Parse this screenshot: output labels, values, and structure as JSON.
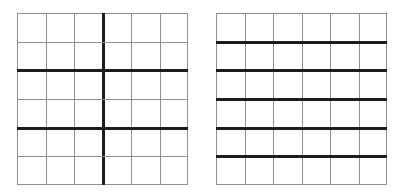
{
  "figure": {
    "background_color": "#ffffff",
    "width": 404,
    "height": 196,
    "thin_line_color": "#8f8f8f",
    "thick_line_color": "#1c1c1c",
    "thin_line_width": 1,
    "thick_line_width": 3,
    "panel_count": 2
  },
  "panels": [
    {
      "id": "left-grid",
      "name": "left-grid",
      "description": "6 by 6 grid with one thick vertical divider at the center and thick horizontal dividers after rows 2 and 4",
      "x": 17,
      "y": 13,
      "width": 171,
      "height": 172,
      "columns": 6,
      "rows": 6,
      "thick_vertical_dividers": [
        3
      ],
      "thick_horizontal_dividers": [
        2,
        4
      ],
      "thin_vertical_dividers": [
        1,
        2,
        4,
        5
      ],
      "thin_horizontal_dividers": [
        1,
        3,
        5
      ]
    },
    {
      "id": "right-grid",
      "name": "right-grid",
      "description": "6 by 6 grid with thick horizontal dividers at every interior row boundary and thin vertical dividers",
      "x": 216,
      "y": 13,
      "width": 171,
      "height": 172,
      "columns": 6,
      "rows": 6,
      "thick_vertical_dividers": [],
      "thick_horizontal_dividers": [
        1,
        2,
        3,
        4,
        5
      ],
      "thin_vertical_dividers": [
        1,
        2,
        3,
        4,
        5
      ],
      "thin_horizontal_dividers": []
    }
  ],
  "chart_data": {
    "type": "table",
    "title": "",
    "subtitle": "",
    "xlabel": "",
    "ylabel": "",
    "grid": true,
    "legend_position": "none",
    "annotations": [],
    "panels": [
      {
        "name": "left-grid",
        "rows": 6,
        "columns": 6,
        "cells_total": 36,
        "emphasized_column_boundaries": [
          3
        ],
        "emphasized_row_boundaries": [
          2,
          4
        ],
        "partition_blocks_horizontal": [
          3,
          3
        ],
        "partition_blocks_vertical": [
          2,
          2,
          2
        ]
      },
      {
        "name": "right-grid",
        "rows": 6,
        "columns": 6,
        "cells_total": 36,
        "emphasized_column_boundaries": [],
        "emphasized_row_boundaries": [
          1,
          2,
          3,
          4,
          5
        ],
        "partition_blocks_horizontal": [
          6
        ],
        "partition_blocks_vertical": [
          1,
          1,
          1,
          1,
          1,
          1
        ]
      }
    ]
  }
}
